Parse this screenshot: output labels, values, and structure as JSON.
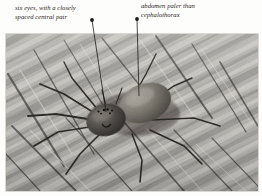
{
  "figure": {
    "type": "annotated-photograph",
    "background_color": "#fdfdfb",
    "photo": {
      "name": "spider-photograph",
      "palette": "grayscale",
      "substrate": "weathered wood bark with diagonal grain",
      "grain_direction": "upper-right to lower-left diagonal",
      "frame": {
        "x": 6,
        "y": 34,
        "width": 252,
        "height": 157
      },
      "tone_light": "#cfcbc3",
      "tone_mid": "#8e8b84",
      "tone_dark": "#2e2c29"
    },
    "annotations": [
      {
        "id": "left",
        "name": "annotation-six-eyes",
        "text": "six eyes, with a closely\nspaced central pair",
        "dot": {
          "x": 92,
          "y": 20
        },
        "target": {
          "x": 106,
          "y": 112
        },
        "line_color": "#1d1b19"
      },
      {
        "id": "right",
        "name": "annotation-abdomen-paler",
        "text": "abdomen paler than\ncephalothorax",
        "dot": {
          "x": 137,
          "y": 19
        },
        "target": {
          "x": 139,
          "y": 96
        },
        "line_color": "#1d1b19"
      }
    ],
    "spider": {
      "name": "spider-subject",
      "cephalothorax": {
        "cx": 104,
        "cy": 118,
        "rx": 20,
        "ry": 16,
        "tone": "#3a3734"
      },
      "abdomen": {
        "cx": 144,
        "cy": 99,
        "rx": 27,
        "ry": 19,
        "tone": "#6e6b64"
      },
      "leg_count": 8,
      "eye_row": "six eyes"
    }
  }
}
